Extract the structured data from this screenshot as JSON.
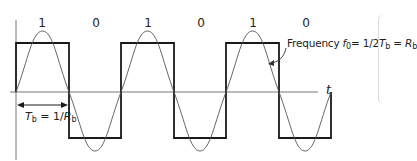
{
  "diagram": {
    "bits": [
      "1",
      "0",
      "1",
      "0",
      "1",
      "0"
    ],
    "axis_label": "t",
    "period_label": {
      "T": "T",
      "T_sub": "b",
      "eq": " = 1/",
      "R": "R",
      "R_sub": "b"
    },
    "frequency_label": {
      "prefix": "Frequency ",
      "f": "f",
      "f_sub": "0",
      "eq": "= 1/2",
      "T": "T",
      "T_sub": "b",
      "eq2": " = ",
      "R": "R",
      "R_sub": "b"
    },
    "colors": {
      "square_wave": "#1a1a1a",
      "sine_wave": "#555555",
      "axis": "#666666",
      "background": "#ffffff"
    },
    "geometry": {
      "bit_width_px": 52.5,
      "transitions_x": [
        16,
        69,
        121,
        174,
        226,
        279,
        331
      ],
      "high_y": 43,
      "low_y": 138,
      "axis_y": 92
    }
  }
}
